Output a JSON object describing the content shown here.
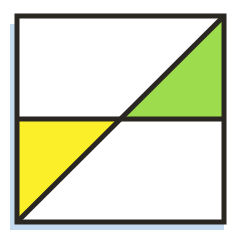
{
  "figure": {
    "title": "Square divided by a diagonal and a horizontal midline",
    "background_color": "#ffffff",
    "shadow_color": "#c3daef",
    "outline_color": "#2a2622",
    "interior_color": "#ffffff",
    "outline_width": 5,
    "square": {
      "name": "outer-square",
      "x": 17,
      "y": 16,
      "width": 207,
      "height": 206
    },
    "lines": [
      {
        "name": "diagonal-line",
        "from": "bottom-left-corner",
        "to": "top-right-corner",
        "x1": 17,
        "y1": 222,
        "x2": 224,
        "y2": 16,
        "color": "#2a2622",
        "width": 5
      },
      {
        "name": "horizontal-midline",
        "from": "left-edge-midpoint",
        "to": "right-edge-midpoint",
        "x1": 17,
        "y1": 119,
        "x2": 224,
        "y2": 119,
        "color": "#2a2622",
        "width": 5
      }
    ],
    "regions": [
      {
        "name": "green-triangle",
        "label": "upper-right shaded triangle",
        "fill": "#9ddc4c",
        "shaded": "true",
        "points": "120.5,119 224,119 224,16"
      },
      {
        "name": "yellow-triangle",
        "label": "lower-left shaded triangle",
        "fill": "#faef28",
        "shaded": "true",
        "points": "17,119 120.5,119 17,222"
      },
      {
        "name": "white-region-top-left",
        "label": "upper-left unshaded region",
        "fill": "#ffffff",
        "shaded": "false",
        "points": "17,16 224,16 120.5,119 17,119"
      },
      {
        "name": "white-region-bottom-right",
        "label": "lower-right unshaded region",
        "fill": "#ffffff",
        "shaded": "false",
        "points": "120.5,119 224,119 224,222 17,222"
      }
    ],
    "shadows": [
      {
        "name": "left-edge-shadow",
        "x": 10,
        "y": 24,
        "width": 7,
        "height": 206
      },
      {
        "name": "bottom-edge-shadow",
        "x": 10,
        "y": 222,
        "width": 214,
        "height": 8
      }
    ]
  }
}
